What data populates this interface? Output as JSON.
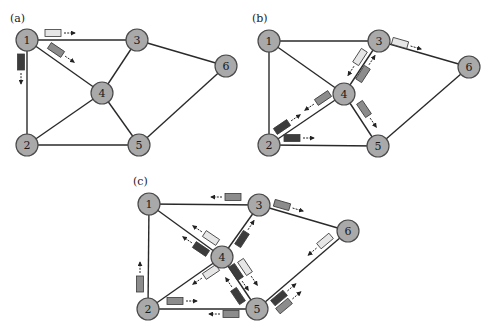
{
  "figure": {
    "colors": {
      "node_fill": "#a9a9a9",
      "node_stroke": "#4a4a4a",
      "edge": "#2a2a2a",
      "packet_light": "#e6e6e6",
      "packet_medium": "#8c8c8c",
      "packet_dark": "#3c3c3c"
    },
    "panels": [
      {
        "label": "(a)",
        "label_pos": [
          10,
          22
        ],
        "nodes": [
          {
            "id": "1",
            "x": 27,
            "y": 40
          },
          {
            "id": "2",
            "x": 27,
            "y": 145
          },
          {
            "id": "3",
            "x": 137,
            "y": 40
          },
          {
            "id": "4",
            "x": 102,
            "y": 93
          },
          {
            "id": "5",
            "x": 139,
            "y": 145
          },
          {
            "id": "6",
            "x": 226,
            "y": 66
          }
        ],
        "edges": [
          [
            "1",
            "3"
          ],
          [
            "1",
            "2"
          ],
          [
            "1",
            "4"
          ],
          [
            "3",
            "4"
          ],
          [
            "3",
            "6"
          ],
          [
            "2",
            "4"
          ],
          [
            "4",
            "5"
          ],
          [
            "2",
            "5"
          ],
          [
            "5",
            "6"
          ]
        ],
        "packets": [
          {
            "x": 53,
            "y": 33,
            "angle": 0,
            "shade": "light",
            "arrow_dir": 0
          },
          {
            "x": 56,
            "y": 50,
            "angle": 34,
            "shade": "medium",
            "arrow_dir": 34
          },
          {
            "x": 21,
            "y": 62,
            "angle": 90,
            "shade": "dark",
            "arrow_dir": 90
          }
        ]
      },
      {
        "label": "(b)",
        "label_pos": [
          252,
          22
        ],
        "nodes": [
          {
            "id": "1",
            "x": 269,
            "y": 41
          },
          {
            "id": "2",
            "x": 269,
            "y": 145
          },
          {
            "id": "3",
            "x": 379,
            "y": 41
          },
          {
            "id": "4",
            "x": 344,
            "y": 94
          },
          {
            "id": "5",
            "x": 378,
            "y": 146
          },
          {
            "id": "6",
            "x": 469,
            "y": 67
          }
        ],
        "edges": [
          [
            "1",
            "3"
          ],
          [
            "1",
            "2"
          ],
          [
            "1",
            "4"
          ],
          [
            "3",
            "4"
          ],
          [
            "3",
            "6"
          ],
          [
            "2",
            "4"
          ],
          [
            "4",
            "5"
          ],
          [
            "2",
            "5"
          ],
          [
            "5",
            "6"
          ]
        ],
        "packets": [
          {
            "x": 400,
            "y": 43,
            "angle": 16,
            "shade": "light",
            "arrow_dir": 16
          },
          {
            "x": 360,
            "y": 57,
            "angle": -57,
            "shade": "light",
            "arrow_dir": 123
          },
          {
            "x": 363,
            "y": 74,
            "angle": -57,
            "shade": "medium",
            "arrow_dir": -57
          },
          {
            "x": 323,
            "y": 98,
            "angle": -34,
            "shade": "medium",
            "arrow_dir": 146
          },
          {
            "x": 282,
            "y": 127,
            "angle": -34,
            "shade": "dark",
            "arrow_dir": -34
          },
          {
            "x": 292,
            "y": 138,
            "angle": 0,
            "shade": "dark",
            "arrow_dir": 0
          },
          {
            "x": 364,
            "y": 109,
            "angle": 56,
            "shade": "medium",
            "arrow_dir": 56
          }
        ]
      },
      {
        "label": "(c)",
        "label_pos": [
          133,
          185
        ],
        "nodes": [
          {
            "id": "1",
            "x": 149,
            "y": 204
          },
          {
            "id": "2",
            "x": 148,
            "y": 309
          },
          {
            "id": "3",
            "x": 259,
            "y": 205
          },
          {
            "id": "4",
            "x": 222,
            "y": 257
          },
          {
            "id": "5",
            "x": 257,
            "y": 309
          },
          {
            "id": "6",
            "x": 348,
            "y": 231
          }
        ],
        "edges": [
          [
            "1",
            "3"
          ],
          [
            "1",
            "2"
          ],
          [
            "1",
            "4"
          ],
          [
            "3",
            "4"
          ],
          [
            "3",
            "6"
          ],
          [
            "2",
            "4"
          ],
          [
            "4",
            "5"
          ],
          [
            "2",
            "5"
          ],
          [
            "5",
            "6"
          ]
        ],
        "packets": [
          {
            "x": 233,
            "y": 197,
            "angle": 0,
            "shade": "medium",
            "arrow_dir": 180
          },
          {
            "x": 282,
            "y": 205,
            "angle": 16,
            "shade": "medium",
            "arrow_dir": 16
          },
          {
            "x": 211,
            "y": 238,
            "angle": 34,
            "shade": "light",
            "arrow_dir": 214
          },
          {
            "x": 201,
            "y": 249,
            "angle": 34,
            "shade": "dark",
            "arrow_dir": 214
          },
          {
            "x": 242,
            "y": 239,
            "angle": -57,
            "shade": "dark",
            "arrow_dir": -57
          },
          {
            "x": 325,
            "y": 241,
            "angle": -40,
            "shade": "light",
            "arrow_dir": 140
          },
          {
            "x": 211,
            "y": 272,
            "angle": -34,
            "shade": "light",
            "arrow_dir": 146
          },
          {
            "x": 245,
            "y": 267,
            "angle": 56,
            "shade": "light",
            "arrow_dir": 56
          },
          {
            "x": 236,
            "y": 272,
            "angle": 56,
            "shade": "dark",
            "arrow_dir": 56
          },
          {
            "x": 238,
            "y": 296,
            "angle": 56,
            "shade": "dark",
            "arrow_dir": 236
          },
          {
            "x": 140,
            "y": 284,
            "angle": 90,
            "shade": "medium",
            "arrow_dir": 270
          },
          {
            "x": 175,
            "y": 301,
            "angle": 0,
            "shade": "medium",
            "arrow_dir": 0
          },
          {
            "x": 231,
            "y": 314,
            "angle": 0,
            "shade": "medium",
            "arrow_dir": 180
          },
          {
            "x": 279,
            "y": 298,
            "angle": -40,
            "shade": "dark",
            "arrow_dir": -40
          },
          {
            "x": 284,
            "y": 306,
            "angle": -40,
            "shade": "medium",
            "arrow_dir": -40
          }
        ]
      }
    ]
  }
}
